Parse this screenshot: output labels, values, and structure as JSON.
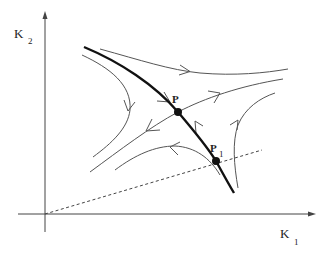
{
  "diagram": {
    "type": "phase-portrait",
    "axes": {
      "x_label": "K",
      "x_subscript": "1",
      "y_label": "K",
      "y_subscript": "2"
    },
    "points": [
      {
        "id": "P",
        "label": "P",
        "subscript": ""
      },
      {
        "id": "P1",
        "label": "P",
        "subscript": "1"
      }
    ],
    "curves": [
      {
        "id": "separatrix",
        "style": "thick",
        "description": "stable manifold through P and P1"
      },
      {
        "id": "unstable-manifold",
        "style": "thin",
        "description": "line through P, flows outward"
      },
      {
        "id": "upper-trajectory",
        "style": "thin",
        "arrow": "right"
      },
      {
        "id": "upper-left-trajectory",
        "style": "thin",
        "arrow": "down"
      },
      {
        "id": "lower-arc-trajectory",
        "style": "thin",
        "arrow": "left"
      },
      {
        "id": "right-trajectory",
        "style": "thin",
        "arrow": "up"
      },
      {
        "id": "ray-from-origin",
        "style": "dashed",
        "description": "ray from origin through P1"
      }
    ],
    "colors": {
      "line": "#555555",
      "thick_line": "#111111",
      "background": "#ffffff"
    }
  }
}
